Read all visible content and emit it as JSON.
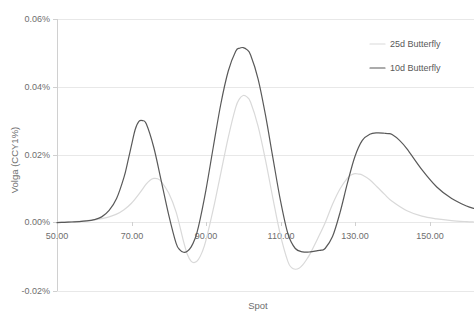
{
  "chart_data": {
    "type": "line",
    "title": "",
    "xlabel": "Spot",
    "ylabel": "Volga (CCY1%)",
    "xlim": [
      50,
      162
    ],
    "ylim": [
      -0.02,
      0.06
    ],
    "x_ticks": [
      "50.00",
      "70.00",
      "90.00",
      "110.00",
      "130.00",
      "150.00"
    ],
    "x_tick_values": [
      50,
      70,
      90,
      110,
      130,
      150
    ],
    "y_ticks": [
      "-0.02%",
      "0.00%",
      "0.02%",
      "0.04%",
      "0.06%"
    ],
    "y_tick_values": [
      -0.02,
      0.0,
      0.02,
      0.04,
      0.06
    ],
    "grid": true,
    "legend_position": "top-right",
    "series": [
      {
        "name": "25d Butterfly",
        "color": "#d9d9d9",
        "x": [
          50,
          52,
          54,
          56,
          58,
          60,
          62,
          64,
          66,
          68,
          70,
          72,
          74,
          75,
          76,
          77,
          78,
          80,
          82,
          84,
          85,
          86,
          87,
          88,
          89,
          90,
          92,
          94,
          96,
          98,
          99,
          100,
          101,
          102,
          104,
          106,
          108,
          110,
          112,
          113,
          114,
          115,
          116,
          117,
          118,
          120,
          122,
          124,
          126,
          128,
          129,
          130,
          131,
          132,
          134,
          136,
          138,
          140,
          144,
          148,
          152,
          156,
          160,
          162
        ],
        "y": [
          0.0002,
          0.0003,
          0.0004,
          0.0005,
          0.0007,
          0.0009,
          0.0013,
          0.0018,
          0.0026,
          0.0039,
          0.0058,
          0.0085,
          0.0115,
          0.0126,
          0.0131,
          0.013,
          0.0122,
          0.0088,
          0.0032,
          -0.0055,
          -0.0092,
          -0.0112,
          -0.0116,
          -0.0107,
          -0.0085,
          -0.0051,
          0.0042,
          0.0147,
          0.0252,
          0.034,
          0.0365,
          0.0375,
          0.0371,
          0.0355,
          0.0285,
          0.0185,
          0.0072,
          -0.0035,
          -0.0113,
          -0.0131,
          -0.0136,
          -0.0133,
          -0.0123,
          -0.0108,
          -0.009,
          -0.0046,
          0.0,
          0.0055,
          0.01,
          0.0132,
          0.0141,
          0.0145,
          0.0144,
          0.0141,
          0.0127,
          0.0106,
          0.0084,
          0.0064,
          0.0036,
          0.002,
          0.0012,
          0.0007,
          0.0004,
          0.0003
        ]
      },
      {
        "name": "10d Butterfly",
        "color": "#595959",
        "x": [
          50,
          52,
          54,
          56,
          58,
          60,
          62,
          64,
          66,
          68,
          69,
          70,
          71,
          72,
          73,
          74,
          76,
          78,
          80,
          82,
          83,
          84,
          85,
          86,
          87,
          88,
          90,
          92,
          94,
          96,
          98,
          99,
          100,
          101,
          102,
          104,
          106,
          108,
          110,
          112,
          114,
          116,
          118,
          120,
          121,
          122,
          124,
          126,
          128,
          130,
          132,
          134,
          136,
          138,
          139,
          140,
          142,
          144,
          148,
          152,
          156,
          160,
          162
        ],
        "y": [
          0.0001,
          0.0002,
          0.0003,
          0.0004,
          0.0006,
          0.001,
          0.0018,
          0.0037,
          0.0072,
          0.0135,
          0.018,
          0.0228,
          0.0275,
          0.0299,
          0.0301,
          0.0291,
          0.0222,
          0.0124,
          0.0024,
          -0.006,
          -0.0079,
          -0.0086,
          -0.0083,
          -0.0071,
          -0.0048,
          -0.0011,
          0.0097,
          0.0225,
          0.035,
          0.0447,
          0.0505,
          0.0514,
          0.0516,
          0.051,
          0.0494,
          0.0424,
          0.0317,
          0.0191,
          0.0067,
          -0.0031,
          -0.0075,
          -0.0085,
          -0.0085,
          -0.0081,
          -0.008,
          -0.0075,
          -0.004,
          0.003,
          0.0117,
          0.0195,
          0.0243,
          0.0261,
          0.0265,
          0.0264,
          0.0263,
          0.026,
          0.0243,
          0.0218,
          0.0157,
          0.0106,
          0.0072,
          0.005,
          0.0043
        ]
      }
    ]
  },
  "legend": {
    "entries": [
      {
        "label": "25d Butterfly"
      },
      {
        "label": "10d Butterfly"
      }
    ]
  }
}
